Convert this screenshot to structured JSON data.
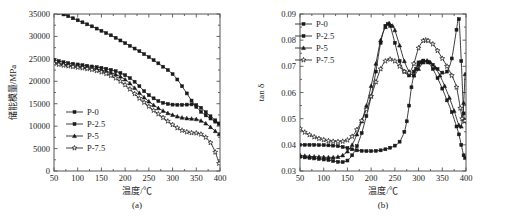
{
  "figure": {
    "panels": [
      "(a)",
      "(b)"
    ]
  },
  "chart_data": [
    {
      "type": "line",
      "panel": "(a)",
      "title": "",
      "xlabel": "温度/℃",
      "ylabel": "储能模量/MPa",
      "xlim": [
        50,
        400
      ],
      "ylim": [
        0,
        35000
      ],
      "xticks": [
        50,
        100,
        150,
        200,
        250,
        300,
        350,
        400
      ],
      "xticklabels": [
        "50",
        "100",
        "150",
        "200",
        "250",
        "300",
        "350",
        "400"
      ],
      "yticks": [
        0,
        5000,
        10000,
        15000,
        20000,
        25000,
        30000,
        35000
      ],
      "yticklabels": [
        "0",
        "5000",
        "10000",
        "15000",
        "20000",
        "25000",
        "30000",
        "35000"
      ],
      "grid": false,
      "legend_position": "center-left",
      "series": [
        {
          "name": "P-0",
          "marker": "square-filled",
          "x": [
            50,
            60,
            70,
            80,
            90,
            100,
            110,
            120,
            130,
            140,
            150,
            160,
            170,
            180,
            190,
            200,
            210,
            220,
            230,
            240,
            250,
            260,
            270,
            280,
            290,
            300,
            310,
            320,
            330,
            340,
            350,
            360,
            370,
            380,
            390,
            398
          ],
          "values": [
            35700,
            35300,
            34900,
            34500,
            34050,
            33600,
            33150,
            32700,
            32250,
            31750,
            31250,
            30750,
            30250,
            29700,
            29100,
            28500,
            27900,
            27300,
            26700,
            26050,
            25400,
            24700,
            24000,
            23250,
            22500,
            21600,
            20400,
            18900,
            17300,
            15700,
            14300,
            13200,
            12400,
            11700,
            11000,
            10500
          ]
        },
        {
          "name": "P-2.5",
          "marker": "square-filled",
          "x": [
            50,
            60,
            70,
            80,
            90,
            100,
            110,
            120,
            130,
            140,
            150,
            160,
            170,
            180,
            190,
            200,
            210,
            220,
            230,
            240,
            250,
            260,
            270,
            280,
            290,
            300,
            310,
            320,
            330,
            340,
            350,
            360,
            370,
            380,
            390,
            398
          ],
          "values": [
            24800,
            24500,
            24250,
            24050,
            23900,
            23750,
            23600,
            23450,
            23300,
            23150,
            23000,
            22800,
            22550,
            22250,
            21850,
            21350,
            20700,
            19900,
            18900,
            17800,
            16900,
            16200,
            15600,
            15200,
            14950,
            14800,
            14750,
            14750,
            14800,
            14850,
            14700,
            14100,
            13100,
            12200,
            11300,
            10600
          ]
        },
        {
          "name": "P-5",
          "marker": "triangle-filled",
          "x": [
            50,
            60,
            70,
            80,
            90,
            100,
            110,
            120,
            130,
            140,
            150,
            160,
            170,
            180,
            190,
            200,
            210,
            220,
            230,
            240,
            250,
            260,
            270,
            280,
            290,
            300,
            310,
            320,
            330,
            340,
            350,
            360,
            370,
            380,
            390,
            398
          ],
          "values": [
            24300,
            24000,
            23800,
            23650,
            23500,
            23350,
            23200,
            23050,
            22900,
            22700,
            22500,
            22250,
            21950,
            21550,
            21050,
            20400,
            19550,
            18500,
            17400,
            16400,
            15500,
            14700,
            14000,
            13400,
            12900,
            12500,
            12150,
            11900,
            11750,
            11650,
            11550,
            11200,
            10600,
            9800,
            8900,
            8200
          ]
        },
        {
          "name": "P-7.5",
          "marker": "star-open",
          "x": [
            50,
            60,
            70,
            80,
            90,
            100,
            110,
            120,
            130,
            140,
            150,
            160,
            170,
            180,
            190,
            200,
            210,
            220,
            230,
            240,
            250,
            260,
            270,
            280,
            290,
            300,
            310,
            320,
            330,
            340,
            350,
            360,
            370,
            380,
            390,
            398
          ],
          "values": [
            24000,
            23750,
            23550,
            23400,
            23250,
            23100,
            22950,
            22800,
            22600,
            22350,
            22050,
            21700,
            21250,
            20700,
            20000,
            19200,
            18250,
            17200,
            16200,
            15300,
            14400,
            13500,
            12700,
            11900,
            11100,
            10300,
            9600,
            9050,
            8700,
            8500,
            8450,
            8200,
            7500,
            6300,
            4200,
            1700
          ]
        }
      ]
    },
    {
      "type": "line",
      "panel": "(b)",
      "title": "",
      "xlabel": "温度/℃",
      "ylabel": "tan δ",
      "xlim": [
        50,
        400
      ],
      "ylim": [
        0.03,
        0.09
      ],
      "xticks": [
        50,
        100,
        150,
        200,
        250,
        300,
        350,
        400
      ],
      "xticklabels": [
        "50",
        "100",
        "150",
        "200",
        "250",
        "300",
        "350",
        "400"
      ],
      "yticks": [
        0.03,
        0.04,
        0.05,
        0.06,
        0.07,
        0.08,
        0.09
      ],
      "yticklabels": [
        "0.03",
        "0.04",
        "0.05",
        "0.06",
        "0.07",
        "0.08",
        "0.09"
      ],
      "grid": false,
      "legend_position": "upper-left",
      "series": [
        {
          "name": "P-0",
          "marker": "square-filled",
          "x": [
            50,
            60,
            70,
            80,
            90,
            100,
            110,
            120,
            130,
            140,
            150,
            160,
            170,
            180,
            190,
            200,
            210,
            220,
            230,
            240,
            250,
            260,
            270,
            275,
            280,
            285,
            290,
            295,
            300,
            305,
            310,
            320,
            330,
            340,
            350,
            360,
            370,
            380,
            385,
            390,
            395,
            398
          ],
          "values": [
            0.04,
            0.04,
            0.04,
            0.04,
            0.0399,
            0.0399,
            0.0398,
            0.0397,
            0.0395,
            0.0392,
            0.0388,
            0.0383,
            0.0379,
            0.0377,
            0.0376,
            0.0376,
            0.0377,
            0.0379,
            0.0383,
            0.0389,
            0.0397,
            0.0412,
            0.045,
            0.049,
            0.055,
            0.062,
            0.0665,
            0.069,
            0.0705,
            0.0715,
            0.072,
            0.0718,
            0.0706,
            0.069,
            0.0676,
            0.068,
            0.073,
            0.084,
            0.088,
            0.072,
            0.052,
            0.049
          ]
        },
        {
          "name": "P-2.5",
          "marker": "square-filled",
          "x": [
            50,
            60,
            70,
            80,
            90,
            100,
            110,
            120,
            130,
            140,
            150,
            160,
            170,
            180,
            190,
            200,
            210,
            220,
            230,
            235,
            240,
            250,
            260,
            270,
            280,
            290,
            300,
            310,
            320,
            330,
            340,
            350,
            360,
            370,
            380,
            385,
            390,
            395,
            398
          ],
          "values": [
            0.0355,
            0.0352,
            0.035,
            0.0348,
            0.0346,
            0.0344,
            0.0342,
            0.0338,
            0.0335,
            0.0334,
            0.034,
            0.036,
            0.0395,
            0.0445,
            0.051,
            0.0585,
            0.068,
            0.079,
            0.0855,
            0.0862,
            0.0855,
            0.079,
            0.072,
            0.068,
            0.0665,
            0.068,
            0.0715,
            0.0722,
            0.0715,
            0.069,
            0.0655,
            0.0615,
            0.057,
            0.0525,
            0.047,
            0.044,
            0.04,
            0.036,
            0.035
          ]
        },
        {
          "name": "P-5",
          "marker": "triangle-filled",
          "x": [
            50,
            60,
            70,
            80,
            90,
            100,
            110,
            120,
            130,
            140,
            150,
            160,
            170,
            180,
            190,
            200,
            210,
            220,
            230,
            238,
            245,
            250,
            260,
            270,
            280,
            290,
            300,
            310,
            318,
            325,
            335,
            345,
            355,
            365,
            375,
            385,
            390,
            395,
            398
          ],
          "values": [
            0.036,
            0.0358,
            0.0356,
            0.0355,
            0.0354,
            0.0353,
            0.0352,
            0.0352,
            0.0354,
            0.036,
            0.0375,
            0.04,
            0.044,
            0.049,
            0.055,
            0.0625,
            0.071,
            0.08,
            0.085,
            0.0865,
            0.0855,
            0.0838,
            0.078,
            0.072,
            0.068,
            0.0665,
            0.069,
            0.0715,
            0.0722,
            0.0715,
            0.0695,
            0.0665,
            0.0625,
            0.058,
            0.053,
            0.0475,
            0.047,
            0.056,
            0.067
          ]
        },
        {
          "name": "P-7.5",
          "marker": "star-open",
          "x": [
            50,
            60,
            70,
            80,
            90,
            100,
            110,
            120,
            130,
            140,
            150,
            160,
            170,
            180,
            190,
            200,
            210,
            220,
            230,
            240,
            250,
            260,
            270,
            280,
            290,
            300,
            310,
            315,
            320,
            330,
            340,
            350,
            360,
            370,
            380,
            388,
            392,
            396,
            398
          ],
          "values": [
            0.0462,
            0.0448,
            0.0438,
            0.043,
            0.0424,
            0.0419,
            0.0415,
            0.0413,
            0.0412,
            0.0413,
            0.0418,
            0.0432,
            0.0458,
            0.0492,
            0.0535,
            0.0585,
            0.064,
            0.069,
            0.072,
            0.0727,
            0.072,
            0.07,
            0.068,
            0.0675,
            0.071,
            0.077,
            0.0798,
            0.08,
            0.0798,
            0.0785,
            0.076,
            0.073,
            0.07,
            0.0665,
            0.062,
            0.054,
            0.05,
            0.049,
            0.0492
          ]
        }
      ]
    }
  ]
}
